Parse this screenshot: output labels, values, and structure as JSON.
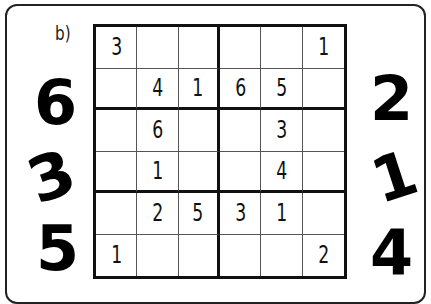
{
  "puzzle": {
    "label": "b)",
    "grid": [
      [
        "3",
        "",
        "",
        "",
        "",
        "1"
      ],
      [
        "",
        "4",
        "1",
        "6",
        "5",
        ""
      ],
      [
        "",
        "6",
        "",
        "",
        "3",
        ""
      ],
      [
        "",
        "1",
        "",
        "",
        "4",
        ""
      ],
      [
        "",
        "2",
        "5",
        "3",
        "1",
        ""
      ],
      [
        "1",
        "",
        "",
        "",
        "",
        "2"
      ]
    ],
    "left_numbers": [
      "6",
      "3",
      "5"
    ],
    "right_numbers": [
      "2",
      "1",
      "4"
    ]
  }
}
